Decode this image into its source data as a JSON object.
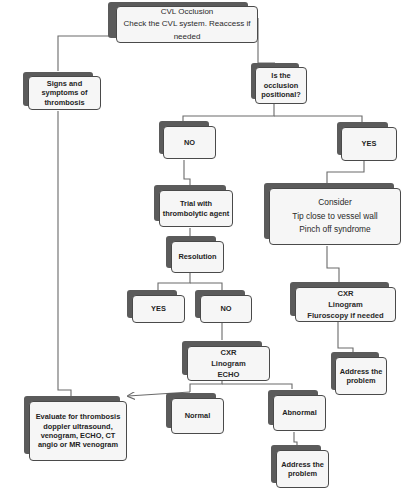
{
  "colors": {
    "box_fill": "#f6f6f6",
    "box_border": "#4a4a4a",
    "box_shadow": "#5b5b5b",
    "connector": "#6a6a6a",
    "text": "#1e1e1e"
  },
  "nodes": {
    "cvl_occlusion": {
      "lines": [
        "CVL Occlusion",
        "Check the CVL system. Reaccess if needed"
      ]
    },
    "signs_symptoms": {
      "lines": [
        "Signs and",
        "symptoms  of",
        "thrombosis"
      ]
    },
    "is_positional": {
      "lines": [
        "Is the",
        "occlusion",
        "positional?"
      ]
    },
    "no_top": {
      "lines": [
        "NO"
      ]
    },
    "yes_top": {
      "lines": [
        "YES"
      ]
    },
    "trial_thrombolytic": {
      "lines": [
        "Trial with",
        "thrombolytic agent"
      ]
    },
    "consider": {
      "lines": [
        "Consider",
        "Tip close to vessel wall",
        "Pinch off syndrome"
      ]
    },
    "resolution": {
      "lines": [
        "Resolution"
      ]
    },
    "yes_mid": {
      "lines": [
        "YES"
      ]
    },
    "no_mid": {
      "lines": [
        "NO"
      ]
    },
    "cxr_echo": {
      "lines": [
        "CXR",
        "Linogram",
        "ECHO"
      ]
    },
    "cxr_fluroscopy": {
      "lines": [
        "CXR",
        "Linogram",
        "Fluroscopy if needed"
      ]
    },
    "address_right": {
      "lines": [
        "Address the",
        "problem"
      ]
    },
    "evaluate_thrombosis": {
      "lines": [
        "Evaluate for thrombosis",
        "doppler ultrasound,",
        "venogram, ECHO, CT",
        "angio or MR venogram"
      ]
    },
    "normal": {
      "lines": [
        "Normal"
      ]
    },
    "abnormal": {
      "lines": [
        "Abnormal"
      ]
    },
    "address_bottom": {
      "lines": [
        "Address the",
        "problem"
      ]
    }
  }
}
